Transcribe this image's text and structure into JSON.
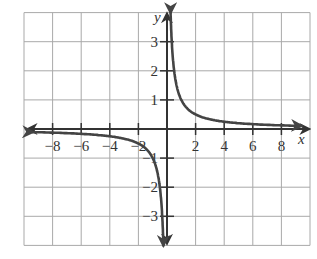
{
  "chart_data": {
    "type": "line",
    "title": "",
    "function": "y = 1/x",
    "xlabel": "x",
    "ylabel": "y",
    "xlim": [
      -10,
      10
    ],
    "ylim": [
      -4,
      4
    ],
    "grid": true,
    "grid_step": {
      "x": 2,
      "y": 1
    },
    "x_ticks": [
      -8,
      -6,
      -4,
      -2,
      2,
      4,
      6,
      8
    ],
    "x_tick_labels": [
      "−8",
      "−6",
      "−4",
      "−2",
      "2",
      "4",
      "6",
      "8"
    ],
    "y_ticks": [
      3,
      2,
      1,
      -1,
      -2,
      -3
    ],
    "y_tick_labels": [
      "3",
      "2",
      "1",
      "−1",
      "−2",
      "−3"
    ],
    "series": [
      {
        "name": "right branch",
        "x": [
          0.25,
          0.3,
          0.4,
          0.5,
          0.75,
          1,
          1.5,
          2,
          3,
          4,
          5,
          6,
          7,
          8,
          9.4
        ],
        "y": [
          4,
          3.33,
          2.5,
          2,
          1.33,
          1,
          0.67,
          0.5,
          0.33,
          0.25,
          0.2,
          0.17,
          0.14,
          0.125,
          0.106
        ]
      },
      {
        "name": "left branch",
        "x": [
          -9.4,
          -8,
          -7,
          -6,
          -5,
          -4,
          -3,
          -2,
          -1.5,
          -1,
          -0.75,
          -0.5,
          -0.4,
          -0.3,
          -0.25
        ],
        "y": [
          -0.106,
          -0.125,
          -0.14,
          -0.17,
          -0.2,
          -0.25,
          -0.33,
          -0.5,
          -0.67,
          -1,
          -1.33,
          -2,
          -2.5,
          -3.33,
          -4
        ]
      }
    ],
    "asymptotes": {
      "vertical": 0,
      "horizontal": 0
    },
    "colors": {
      "curve": "#444444",
      "grid": "#a9a9a9",
      "axis": "#333333"
    }
  }
}
